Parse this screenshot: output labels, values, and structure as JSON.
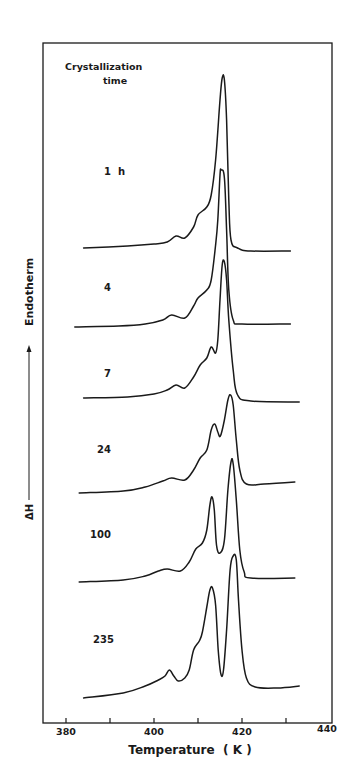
{
  "chart_data": {
    "type": "line",
    "title": "",
    "legend_title": [
      "Crystallization",
      "time"
    ],
    "xlabel": "Temperature  ( K )",
    "ylabel": "ΔH",
    "ylabel_arrow_text": "Endotherm",
    "xlim": [
      380,
      440
    ],
    "xticks": [
      380,
      390,
      400,
      410,
      420,
      430,
      440
    ],
    "xtick_labels": [
      "380",
      "",
      "400",
      "",
      "420",
      "",
      "440"
    ],
    "grid": false,
    "y_units": "arbitrary (curves vertically offset)",
    "series": [
      {
        "name": "1 h",
        "label": "1  h",
        "points": [
          [
            384,
            248
          ],
          [
            394,
            246
          ],
          [
            400,
            244
          ],
          [
            403,
            242
          ],
          [
            405,
            236
          ],
          [
            407,
            238
          ],
          [
            409,
            227
          ],
          [
            410,
            215
          ],
          [
            412,
            207
          ],
          [
            413,
            195
          ],
          [
            414,
            160
          ],
          [
            415,
            100
          ],
          [
            415.5,
            78
          ],
          [
            416,
            80
          ],
          [
            416.5,
            120
          ],
          [
            417,
            200
          ],
          [
            417.5,
            240
          ],
          [
            419,
            248
          ],
          [
            422,
            251
          ],
          [
            431,
            251
          ]
        ]
      },
      {
        "name": "4",
        "label": "4",
        "points": [
          [
            382,
            327
          ],
          [
            392,
            326
          ],
          [
            398,
            324
          ],
          [
            402,
            320
          ],
          [
            404,
            315
          ],
          [
            407,
            318
          ],
          [
            409,
            306
          ],
          [
            410,
            298
          ],
          [
            412,
            290
          ],
          [
            413,
            280
          ],
          [
            414,
            245
          ],
          [
            414.5,
            220
          ],
          [
            415,
            175
          ],
          [
            415.3,
            170
          ],
          [
            416,
            178
          ],
          [
            416.5,
            230
          ],
          [
            417,
            290
          ],
          [
            418,
            320
          ],
          [
            420,
            324
          ],
          [
            431,
            324
          ]
        ]
      },
      {
        "name": "7",
        "label": "7",
        "points": [
          [
            384,
            398
          ],
          [
            394,
            397
          ],
          [
            400,
            394
          ],
          [
            403,
            390
          ],
          [
            405,
            385
          ],
          [
            407,
            388
          ],
          [
            409,
            377
          ],
          [
            410.5,
            365
          ],
          [
            412,
            358
          ],
          [
            413,
            347
          ],
          [
            414,
            353
          ],
          [
            414.5,
            340
          ],
          [
            415,
            300
          ],
          [
            415.5,
            265
          ],
          [
            416,
            262
          ],
          [
            416.5,
            280
          ],
          [
            417,
            320
          ],
          [
            418,
            370
          ],
          [
            419,
            395
          ],
          [
            422,
            401
          ],
          [
            433,
            402
          ]
        ]
      },
      {
        "name": "24",
        "label": "24",
        "points": [
          [
            383,
            493
          ],
          [
            393,
            491
          ],
          [
            398,
            487
          ],
          [
            402,
            481
          ],
          [
            404,
            478
          ],
          [
            407,
            480
          ],
          [
            409,
            470
          ],
          [
            410.5,
            458
          ],
          [
            412,
            450
          ],
          [
            413,
            430
          ],
          [
            413.8,
            424
          ],
          [
            414.5,
            432
          ],
          [
            415.1,
            436
          ],
          [
            416,
            420
          ],
          [
            416.8,
            400
          ],
          [
            417.4,
            395
          ],
          [
            418,
            405
          ],
          [
            418.7,
            440
          ],
          [
            419.5,
            470
          ],
          [
            421,
            484
          ],
          [
            425,
            484
          ],
          [
            432,
            482
          ]
        ]
      },
      {
        "name": "100",
        "label": "100",
        "points": [
          [
            383,
            582
          ],
          [
            393,
            580
          ],
          [
            398,
            576
          ],
          [
            401,
            571
          ],
          [
            403,
            569
          ],
          [
            406,
            571
          ],
          [
            408,
            562
          ],
          [
            409.5,
            549
          ],
          [
            411,
            543
          ],
          [
            412,
            530
          ],
          [
            412.7,
            505
          ],
          [
            413.2,
            497
          ],
          [
            413.7,
            510
          ],
          [
            414.2,
            545
          ],
          [
            415,
            553
          ],
          [
            416,
            540
          ],
          [
            416.8,
            490
          ],
          [
            417.5,
            462
          ],
          [
            418,
            464
          ],
          [
            418.7,
            500
          ],
          [
            419.5,
            550
          ],
          [
            420.5,
            572
          ],
          [
            422,
            578
          ],
          [
            432,
            578
          ]
        ]
      },
      {
        "name": "235",
        "label": "235",
        "points": [
          [
            384,
            698
          ],
          [
            393,
            693
          ],
          [
            398,
            686
          ],
          [
            401,
            680
          ],
          [
            402.5,
            676
          ],
          [
            403.5,
            670
          ],
          [
            404.5,
            676
          ],
          [
            405.5,
            681
          ],
          [
            407,
            678
          ],
          [
            408,
            670
          ],
          [
            409,
            650
          ],
          [
            410.3,
            641
          ],
          [
            411,
            632
          ],
          [
            412,
            607
          ],
          [
            412.7,
            590
          ],
          [
            413.3,
            588
          ],
          [
            414,
            605
          ],
          [
            414.6,
            650
          ],
          [
            415.2,
            674
          ],
          [
            415.8,
            670
          ],
          [
            416.5,
            630
          ],
          [
            417.3,
            570
          ],
          [
            418,
            556
          ],
          [
            418.7,
            560
          ],
          [
            419.2,
            600
          ],
          [
            420,
            650
          ],
          [
            421,
            678
          ],
          [
            423,
            687
          ],
          [
            428,
            688
          ],
          [
            433,
            686
          ]
        ]
      }
    ]
  },
  "axes": {
    "legend_title_line1": "Crystallization",
    "legend_title_line2": "time",
    "x_axis_title": "Temperature  ( K )",
    "y_axis_symbol": "ΔH",
    "y_axis_word": "Endotherm",
    "tick_labels": [
      "380",
      "400",
      "420",
      "440"
    ]
  },
  "curve_labels": [
    "1  h",
    "4",
    "7",
    "24",
    "100",
    "235"
  ],
  "colors": {
    "ink": "#1a1a1a",
    "background": "#ffffff"
  }
}
